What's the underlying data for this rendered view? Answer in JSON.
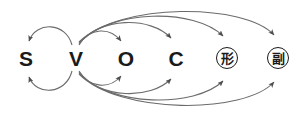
{
  "diagram": {
    "background_color": "#ffffff",
    "arc_color": "#6b6b6b",
    "node_color": "#1a1a1a",
    "nodes": [
      {
        "id": "S",
        "label": "S",
        "kind": "latin",
        "x": 26,
        "y": 58,
        "circled": false
      },
      {
        "id": "V",
        "label": "V",
        "kind": "latin",
        "x": 76,
        "y": 58,
        "circled": false
      },
      {
        "id": "O",
        "label": "O",
        "kind": "latin",
        "x": 126,
        "y": 58,
        "circled": false
      },
      {
        "id": "C",
        "label": "C",
        "kind": "latin",
        "x": 176,
        "y": 58,
        "circled": false
      },
      {
        "id": "KEI",
        "label": "形",
        "kind": "cjk",
        "x": 227,
        "y": 58,
        "circled": true
      },
      {
        "id": "FUKU",
        "label": "副",
        "kind": "cjk",
        "x": 278,
        "y": 58,
        "circled": true
      }
    ],
    "edges": [
      {
        "from": "V",
        "to": "S",
        "side": "top",
        "label": "V to S upper arc"
      },
      {
        "from": "V",
        "to": "S",
        "side": "bottom",
        "label": "V to S lower arc"
      },
      {
        "from": "V",
        "to": "O",
        "side": "top",
        "label": "V to O upper arc"
      },
      {
        "from": "V",
        "to": "C",
        "side": "top",
        "label": "V to C upper arc"
      },
      {
        "from": "V",
        "to": "KEI",
        "side": "top",
        "label": "V to adjective upper arc"
      },
      {
        "from": "V",
        "to": "FUKU",
        "side": "top",
        "label": "V to adverb upper arc"
      },
      {
        "from": "V",
        "to": "O",
        "side": "bottom",
        "label": "V to O lower arc"
      },
      {
        "from": "V",
        "to": "C",
        "side": "bottom",
        "label": "V to C lower arc"
      },
      {
        "from": "V",
        "to": "KEI",
        "side": "bottom",
        "label": "V to adjective lower arc"
      },
      {
        "from": "V",
        "to": "FUKU",
        "side": "bottom",
        "label": "V to adverb lower arc"
      }
    ]
  }
}
